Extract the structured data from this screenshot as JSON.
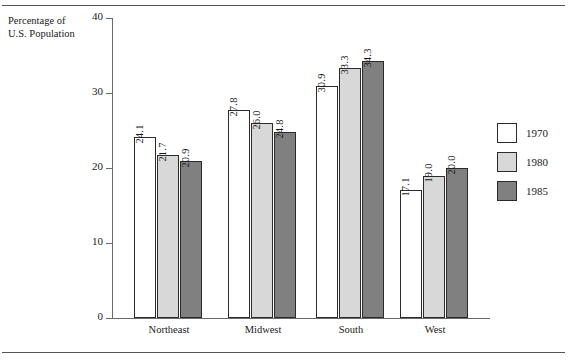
{
  "figure": {
    "clipped_caption": "",
    "axis_title_line1": "Percentage of",
    "axis_title_line2": "U.S. Population"
  },
  "legend": {
    "items": [
      {
        "label": "1970",
        "color": "#ffffff"
      },
      {
        "label": "1980",
        "color": "#d8d8d8"
      },
      {
        "label": "1985",
        "color": "#808080"
      }
    ]
  },
  "chart_data": {
    "type": "bar",
    "title": "",
    "subtitle": "",
    "xlabel": "",
    "ylabel": "Percentage of U.S. Population",
    "ylim": [
      0,
      40
    ],
    "yticks": [
      "0",
      "10",
      "20",
      "30",
      "40"
    ],
    "ytick_values": [
      0,
      10,
      20,
      30,
      40
    ],
    "grid": false,
    "legend_position": "right",
    "categories": [
      "Northeast",
      "Midwest",
      "South",
      "West"
    ],
    "series": [
      {
        "name": "1970",
        "color": "#ffffff",
        "values": [
          24.1,
          27.8,
          30.9,
          17.1
        ]
      },
      {
        "name": "1980",
        "color": "#d8d8d8",
        "values": [
          21.7,
          26.0,
          33.3,
          19.0
        ]
      },
      {
        "name": "1985",
        "color": "#808080",
        "values": [
          20.9,
          24.8,
          34.3,
          20.0
        ]
      }
    ],
    "data_labels": [
      [
        "24.1",
        "21.7",
        "20.9"
      ],
      [
        "27.8",
        "26.0",
        "24.8"
      ],
      [
        "30.9",
        "33.3",
        "34.3"
      ],
      [
        "17.1",
        "19.0",
        "20.0"
      ]
    ]
  }
}
